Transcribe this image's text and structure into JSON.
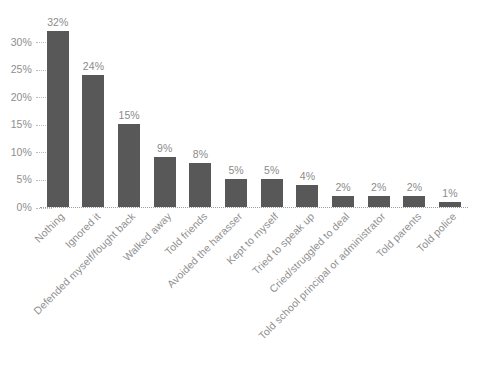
{
  "chart_data": {
    "type": "bar",
    "title": "",
    "subtitle": "",
    "xlabel": "",
    "ylabel": "",
    "ylim": [
      0,
      35
    ],
    "grid": false,
    "legend": "none",
    "orientation": "vertical",
    "value_label_format": "percent",
    "categories": [
      "Nothing",
      "Ignored it",
      "Defended myself/fought back",
      "Walked away",
      "Told friends",
      "Avoided the harasser",
      "Kept to myself",
      "Tried to speak up",
      "Cried/struggled to deal",
      "Told school principal or administrator",
      "Told parents",
      "Told police"
    ],
    "values": [
      32,
      24,
      15,
      9,
      8,
      5,
      5,
      4,
      2,
      2,
      2,
      1
    ],
    "value_labels": [
      "32%",
      "24%",
      "15%",
      "9%",
      "8%",
      "5%",
      "5%",
      "4%",
      "2%",
      "2%",
      "2%",
      "1%"
    ],
    "y_ticks": [
      0,
      5,
      10,
      15,
      20,
      25,
      30
    ],
    "y_tick_labels": [
      "0%",
      "5%",
      "10%",
      "15%",
      "20%",
      "25%",
      "30%"
    ],
    "colors": {
      "bar": "#585858",
      "value_label": "#8b8b8b",
      "tick_label": "#8e8e8e",
      "category_label": "#909090",
      "axis_line": "#9d9d9d",
      "background": "#ffffff"
    }
  }
}
